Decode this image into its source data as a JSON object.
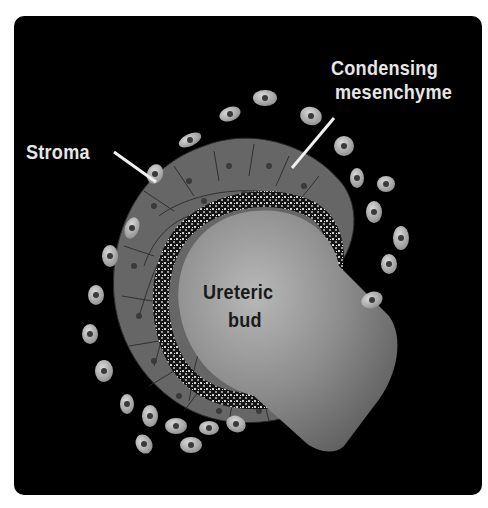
{
  "diagram": {
    "background": "#000000",
    "frame_color": "#ffffff",
    "labels": {
      "stroma": "Stroma",
      "condensing_line1": "Condensing",
      "condensing_line2": "mesenchyme",
      "ureteric_line1": "Ureteric",
      "ureteric_line2": "bud"
    },
    "colors": {
      "stroma_cell": "#bdbdbd",
      "mesenchyme_cell": "#6e6e6e",
      "nucleus": "#3c3c3c",
      "ureteric_bud": "#8a8a8a",
      "speckle_band": "#1b1b1b",
      "pointer_line": "#f0f0f0"
    }
  }
}
